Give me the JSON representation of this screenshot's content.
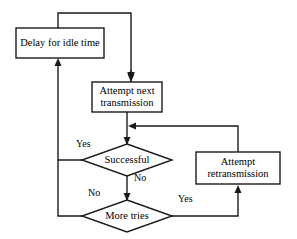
{
  "diagram": {
    "type": "flowchart",
    "stroke_color": "#1a1a1a",
    "fill_color": "#ffffff",
    "background_color": "#ffffff",
    "nodes": [
      {
        "id": "delay",
        "shape": "rectangle",
        "label": "Delay for idle time",
        "x": 16,
        "y": 28,
        "width": 88,
        "height": 30
      },
      {
        "id": "attempt-next",
        "shape": "rectangle",
        "label": "Attempt next\ntransmission",
        "x": 92,
        "y": 82,
        "width": 70,
        "height": 30
      },
      {
        "id": "successful",
        "shape": "diamond",
        "label": "Successful",
        "x": 92,
        "y": 144,
        "width": 80,
        "height": 32
      },
      {
        "id": "attempt-retransmission",
        "shape": "rectangle",
        "label": "Attempt\nretransmission",
        "x": 196,
        "y": 152,
        "width": 84,
        "height": 32
      },
      {
        "id": "more-tries",
        "shape": "diamond",
        "label": "More tries",
        "x": 92,
        "y": 200,
        "width": 80,
        "height": 32
      }
    ],
    "edge_labels": [
      {
        "id": "successful-yes",
        "text": "Yes",
        "x": 76,
        "y": 139
      },
      {
        "id": "successful-no",
        "text": "No",
        "x": 134,
        "y": 173
      },
      {
        "id": "more-tries-no",
        "text": "No",
        "x": 88,
        "y": 188
      },
      {
        "id": "more-tries-yes",
        "text": "Yes",
        "x": 178,
        "y": 194
      }
    ],
    "edges": [
      {
        "id": "delay-to-attempt-next",
        "from": "delay",
        "to": "attempt-next",
        "route": "top-loop"
      },
      {
        "id": "attempt-next-to-successful",
        "from": "attempt-next",
        "to": "successful",
        "route": "down"
      },
      {
        "id": "successful-yes-to-delay",
        "from": "successful",
        "to": "delay",
        "label": "Yes",
        "route": "left-up"
      },
      {
        "id": "successful-no-to-more-tries",
        "from": "successful",
        "to": "more-tries",
        "label": "No",
        "route": "down"
      },
      {
        "id": "more-tries-yes-to-retransmission",
        "from": "more-tries",
        "to": "attempt-retransmission",
        "label": "Yes",
        "route": "right-up"
      },
      {
        "id": "more-tries-no-to-delay",
        "from": "more-tries",
        "to": "delay",
        "label": "No",
        "route": "left-up"
      },
      {
        "id": "retransmission-to-successful",
        "from": "attempt-retransmission",
        "to": "successful",
        "route": "up-left"
      }
    ]
  }
}
